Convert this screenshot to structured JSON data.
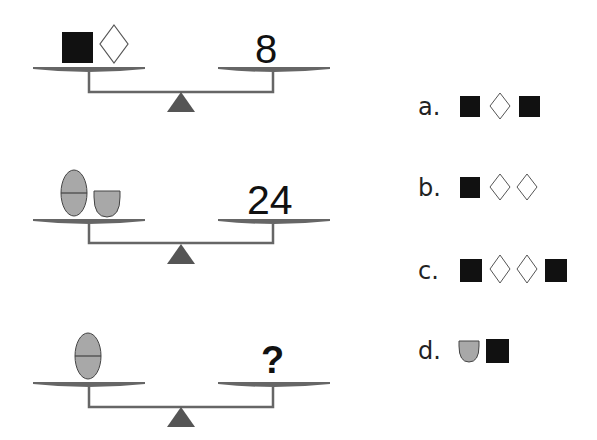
{
  "puzzle": {
    "colors": {
      "square": "#111111",
      "diamond_stroke": "#555555",
      "gray_shape": "#a8a8a8",
      "shape_stroke": "#444444",
      "scale": "#666666",
      "text": "#111111"
    },
    "scales": [
      {
        "left_items": [
          "black-square",
          "white-diamond"
        ],
        "right_value": "8"
      },
      {
        "left_items": [
          "gray-oval",
          "gray-bowl"
        ],
        "right_value": "24"
      },
      {
        "left_items": [
          "gray-oval"
        ],
        "right_value": "?"
      }
    ],
    "options": [
      {
        "label": "a.",
        "items": [
          "black-square",
          "white-diamond",
          "black-square"
        ]
      },
      {
        "label": "b.",
        "items": [
          "black-square",
          "white-diamond",
          "white-diamond"
        ]
      },
      {
        "label": "c.",
        "items": [
          "black-square",
          "white-diamond",
          "white-diamond",
          "black-square"
        ]
      },
      {
        "label": "d.",
        "items": [
          "gray-bowl",
          "black-square"
        ]
      }
    ]
  }
}
